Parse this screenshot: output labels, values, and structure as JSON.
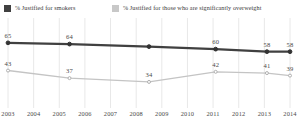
{
  "chart_data": {
    "type": "line",
    "title": "",
    "subtitle": "",
    "xlabel": "",
    "ylabel": "",
    "grid": "vertical",
    "legend_position": "top",
    "xlim": [
      2003,
      2014
    ],
    "ylim": [
      0,
      100
    ],
    "tick_labels": [
      "2003",
      "2004",
      "2005",
      "2006",
      "2007",
      "2008",
      "2009",
      "2010",
      "2011",
      "2012",
      "2013",
      "2014"
    ],
    "series": [
      {
        "name": "% Justified for smokers",
        "color": "#404040",
        "marker_color": "#333333",
        "points": [
          {
            "x": 2003.0,
            "y": 65,
            "label": "65"
          },
          {
            "x": 2005.4,
            "y": 64,
            "label": "64"
          },
          {
            "x": 2008.5,
            "y": 62,
            "label": ""
          },
          {
            "x": 2011.1,
            "y": 60,
            "label": "60"
          },
          {
            "x": 2013.1,
            "y": 58,
            "label": "58"
          },
          {
            "x": 2014.0,
            "y": 58,
            "label": "58"
          }
        ]
      },
      {
        "name": "% Justified for those who are significantly overweight",
        "color": "#c4c4c4",
        "marker_color": "#b0b0b0",
        "points": [
          {
            "x": 2003.0,
            "y": 43,
            "label": "43"
          },
          {
            "x": 2005.4,
            "y": 37,
            "label": "37"
          },
          {
            "x": 2008.5,
            "y": 34,
            "label": "34"
          },
          {
            "x": 2011.1,
            "y": 42,
            "label": "42"
          },
          {
            "x": 2013.1,
            "y": 41,
            "label": "41"
          },
          {
            "x": 2014.0,
            "y": 39,
            "label": "39"
          }
        ]
      }
    ]
  },
  "legend": {
    "entries": [
      {
        "label": "% Justified for smokers",
        "color": "#404040"
      },
      {
        "label": "% Justified for those who are significantly overweight",
        "color": "#c8c8c8"
      }
    ]
  },
  "colors": {
    "background": "#ffffff",
    "gridline": "#e8e8e8",
    "text": "#4a4a4a",
    "series_dark": "#404040",
    "series_light": "#c4c4c4"
  }
}
